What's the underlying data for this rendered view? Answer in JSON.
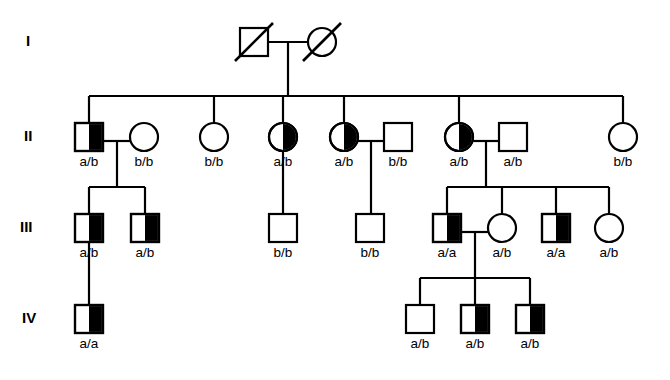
{
  "figure": {
    "type": "pedigree-chart",
    "symbol_size": 28,
    "colors": {
      "line": "#000000",
      "affected_fill": "#000000",
      "unaffected_fill": "#ffffff",
      "background": "#ffffff"
    },
    "legend_semantics": {
      "square": "male",
      "circle": "female",
      "half_filled": "carrier / heterozygous shading",
      "open": "unshaded",
      "slash": "deceased"
    }
  },
  "generations": [
    {
      "id": "gen-1",
      "label": "I",
      "label_x": 26,
      "label_y": 46,
      "row_y": 42
    },
    {
      "id": "gen-2",
      "label": "II",
      "label_x": 24,
      "label_y": 141,
      "row_y": 137
    },
    {
      "id": "gen-3",
      "label": "III",
      "label_x": 20,
      "label_y": 232,
      "row_y": 228
    },
    {
      "id": "gen-4",
      "label": "IV",
      "label_x": 22,
      "label_y": 323,
      "row_y": 319
    }
  ],
  "individuals": [
    {
      "id": "I-1",
      "generation": "I",
      "sex": "male",
      "shape": "square",
      "fill": "open",
      "deceased": true,
      "genotype": "",
      "cx": 254,
      "cy": 42
    },
    {
      "id": "I-2",
      "generation": "I",
      "sex": "female",
      "shape": "circle",
      "fill": "open",
      "deceased": true,
      "genotype": "",
      "cx": 322,
      "cy": 42
    },
    {
      "id": "II-1",
      "generation": "II",
      "sex": "male",
      "shape": "square",
      "fill": "half-right",
      "deceased": false,
      "genotype": "a/b",
      "cx": 89,
      "cy": 137
    },
    {
      "id": "II-2",
      "generation": "II",
      "sex": "female",
      "shape": "circle",
      "fill": "open",
      "deceased": false,
      "genotype": "b/b",
      "cx": 144,
      "cy": 137
    },
    {
      "id": "II-3",
      "generation": "II",
      "sex": "female",
      "shape": "circle",
      "fill": "open",
      "deceased": false,
      "genotype": "b/b",
      "cx": 214,
      "cy": 137
    },
    {
      "id": "II-4",
      "generation": "II",
      "sex": "female",
      "shape": "circle",
      "fill": "half-right",
      "deceased": false,
      "genotype": "a/b",
      "cx": 283,
      "cy": 137
    },
    {
      "id": "II-5",
      "generation": "II",
      "sex": "female",
      "shape": "circle",
      "fill": "half-right",
      "deceased": false,
      "genotype": "a/b",
      "cx": 344,
      "cy": 137
    },
    {
      "id": "II-6",
      "generation": "II",
      "sex": "male",
      "shape": "square",
      "fill": "open",
      "deceased": false,
      "genotype": "b/b",
      "cx": 398,
      "cy": 137
    },
    {
      "id": "II-7",
      "generation": "II",
      "sex": "female",
      "shape": "circle",
      "fill": "half-right",
      "deceased": false,
      "genotype": "a/b",
      "cx": 459,
      "cy": 137
    },
    {
      "id": "II-8",
      "generation": "II",
      "sex": "male",
      "shape": "square",
      "fill": "open",
      "deceased": false,
      "genotype": "a/b",
      "cx": 513,
      "cy": 137
    },
    {
      "id": "II-9",
      "generation": "II",
      "sex": "female",
      "shape": "circle",
      "fill": "open",
      "deceased": false,
      "genotype": "b/b",
      "cx": 623,
      "cy": 137
    },
    {
      "id": "III-1",
      "generation": "III",
      "sex": "male",
      "shape": "square",
      "fill": "half-right",
      "deceased": false,
      "genotype": "a/b",
      "cx": 89,
      "cy": 228
    },
    {
      "id": "III-2",
      "generation": "III",
      "sex": "male",
      "shape": "square",
      "fill": "half-right",
      "deceased": false,
      "genotype": "a/b",
      "cx": 145,
      "cy": 228
    },
    {
      "id": "III-3",
      "generation": "III",
      "sex": "male",
      "shape": "square",
      "fill": "open",
      "deceased": false,
      "genotype": "b/b",
      "cx": 283,
      "cy": 228
    },
    {
      "id": "III-4",
      "generation": "III",
      "sex": "male",
      "shape": "square",
      "fill": "open",
      "deceased": false,
      "genotype": "b/b",
      "cx": 370,
      "cy": 228
    },
    {
      "id": "III-5",
      "generation": "III",
      "sex": "male",
      "shape": "square",
      "fill": "half-right",
      "deceased": false,
      "genotype": "a/a",
      "cx": 447,
      "cy": 228
    },
    {
      "id": "III-6",
      "generation": "III",
      "sex": "female",
      "shape": "circle",
      "fill": "open",
      "deceased": false,
      "genotype": "a/b",
      "cx": 502,
      "cy": 228
    },
    {
      "id": "III-7",
      "generation": "III",
      "sex": "male",
      "shape": "square",
      "fill": "half-right",
      "deceased": false,
      "genotype": "a/a",
      "cx": 556,
      "cy": 228
    },
    {
      "id": "III-8",
      "generation": "III",
      "sex": "female",
      "shape": "circle",
      "fill": "open",
      "deceased": false,
      "genotype": "a/b",
      "cx": 609,
      "cy": 228
    },
    {
      "id": "IV-1",
      "generation": "IV",
      "sex": "male",
      "shape": "square",
      "fill": "half-right",
      "deceased": false,
      "genotype": "a/a",
      "cx": 89,
      "cy": 319
    },
    {
      "id": "IV-2",
      "generation": "IV",
      "sex": "male",
      "shape": "square",
      "fill": "open",
      "deceased": false,
      "genotype": "a/b",
      "cx": 420,
      "cy": 319
    },
    {
      "id": "IV-3",
      "generation": "IV",
      "sex": "male",
      "shape": "square",
      "fill": "half-right",
      "deceased": false,
      "genotype": "a/b",
      "cx": 475,
      "cy": 319
    },
    {
      "id": "IV-4",
      "generation": "IV",
      "sex": "male",
      "shape": "square",
      "fill": "half-right",
      "deceased": false,
      "genotype": "a/b",
      "cx": 530,
      "cy": 319
    }
  ],
  "connections": [
    {
      "id": "mating-I",
      "kind": "mating",
      "points": "268,42 308,42"
    },
    {
      "id": "descent-I",
      "kind": "descent",
      "points": "288,42 288,96"
    },
    {
      "id": "sibship-II",
      "kind": "sibship",
      "points": "89,96 623,96"
    },
    {
      "id": "drop-II-1",
      "kind": "drop",
      "points": "89,96 89,123"
    },
    {
      "id": "drop-II-3",
      "kind": "drop",
      "points": "214,96 214,123"
    },
    {
      "id": "drop-II-4",
      "kind": "drop",
      "points": "283,96 283,123"
    },
    {
      "id": "drop-II-5",
      "kind": "drop",
      "points": "344,96 344,123"
    },
    {
      "id": "drop-II-7",
      "kind": "drop",
      "points": "459,96 459,123"
    },
    {
      "id": "drop-II-9",
      "kind": "drop",
      "points": "623,96 623,123"
    },
    {
      "id": "mating-II-1-2",
      "kind": "mating",
      "points": "103,141 130,141"
    },
    {
      "id": "descent-II-1-2",
      "kind": "descent",
      "points": "117,141 117,187"
    },
    {
      "id": "sibship-III-a",
      "kind": "sibship",
      "points": "89,187 145,187"
    },
    {
      "id": "drop-III-1",
      "kind": "drop",
      "points": "89,187 89,214"
    },
    {
      "id": "drop-III-2",
      "kind": "drop",
      "points": "145,187 145,214"
    },
    {
      "id": "descent-II-4",
      "kind": "descent",
      "points": "283,151 283,214"
    },
    {
      "id": "mating-II-5-6",
      "kind": "mating",
      "points": "358,141 384,141"
    },
    {
      "id": "descent-II-5-6",
      "kind": "descent",
      "points": "371,141 371,214"
    },
    {
      "id": "mating-II-7-8",
      "kind": "mating",
      "points": "473,141 499,141"
    },
    {
      "id": "descent-II-7-8",
      "kind": "descent",
      "points": "486,141 486,187"
    },
    {
      "id": "sibship-III-b",
      "kind": "sibship",
      "points": "447,187 556,187"
    },
    {
      "id": "drop-III-5",
      "kind": "drop",
      "points": "447,187 447,214"
    },
    {
      "id": "drop-III-7",
      "kind": "drop",
      "points": "556,187 556,214"
    },
    {
      "id": "drop-III-6",
      "kind": "drop",
      "points": "502,187 502,214"
    },
    {
      "id": "drop-III-8",
      "kind": "drop",
      "points": "609,187 609,214"
    },
    {
      "id": "sibship-III-b2",
      "kind": "sibship",
      "points": "502,187 609,187"
    },
    {
      "id": "descent-III-1",
      "kind": "descent",
      "points": "89,242 89,305"
    },
    {
      "id": "mating-III-5-6",
      "kind": "mating",
      "points": "461,232 488,232"
    },
    {
      "id": "descent-III-5-6",
      "kind": "descent",
      "points": "475,232 475,278"
    },
    {
      "id": "sibship-IV",
      "kind": "sibship",
      "points": "420,278 530,278"
    },
    {
      "id": "drop-IV-2",
      "kind": "drop",
      "points": "420,278 420,305"
    },
    {
      "id": "drop-IV-3",
      "kind": "drop",
      "points": "475,278 475,305"
    },
    {
      "id": "drop-IV-4",
      "kind": "drop",
      "points": "530,278 530,305"
    }
  ]
}
